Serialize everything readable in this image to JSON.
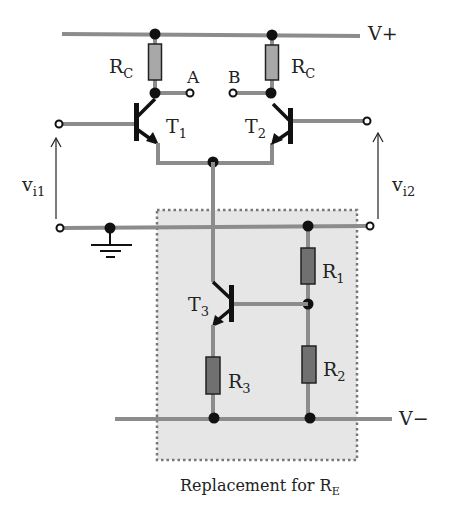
{
  "diagram": {
    "type": "differential-amplifier-circuit",
    "caption": {
      "text": "Replacement for R",
      "subscript": "E"
    },
    "rails": {
      "positive": {
        "label": "V+"
      },
      "negative": {
        "label": "V−"
      }
    },
    "transistors": [
      {
        "id": "T1",
        "base": "T",
        "sub": "1"
      },
      {
        "id": "T2",
        "base": "T",
        "sub": "2"
      },
      {
        "id": "T3",
        "base": "T",
        "sub": "3"
      }
    ],
    "resistors": [
      {
        "id": "Rc_left",
        "base": "R",
        "sub": "C"
      },
      {
        "id": "Rc_right",
        "base": "R",
        "sub": "C"
      },
      {
        "id": "R1",
        "base": "R",
        "sub": "1"
      },
      {
        "id": "R2",
        "base": "R",
        "sub": "2"
      },
      {
        "id": "R3",
        "base": "R",
        "sub": "3"
      }
    ],
    "outputs": [
      {
        "id": "A",
        "label": "A"
      },
      {
        "id": "B",
        "label": "B"
      }
    ],
    "inputs": [
      {
        "id": "vi1",
        "base": "v",
        "sub": "i1"
      },
      {
        "id": "vi2",
        "base": "v",
        "sub": "i2"
      }
    ],
    "colors": {
      "wire": "#8c8c8c",
      "collector_resistor": "#a8a8a8",
      "resistor_dark": "#707070",
      "replacement_box_fill": "#e6e6e6"
    }
  }
}
